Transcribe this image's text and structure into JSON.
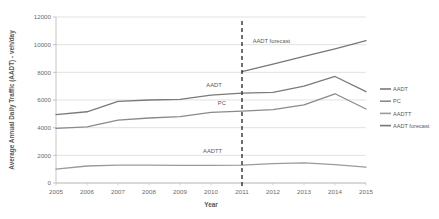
{
  "chart_data": {
    "type": "line",
    "title": "",
    "xlabel": "Year",
    "ylabel": "Average Annual Daily Traffic (AADT) - veh/day",
    "x": [
      2005,
      2006,
      2007,
      2008,
      2009,
      2010,
      2011,
      2012,
      2013,
      2014,
      2015
    ],
    "xtick_labels": [
      "2005",
      "2006",
      "2007",
      "2008",
      "2009",
      "2010",
      "2011",
      "2012",
      "2013",
      "2014",
      "2015"
    ],
    "ytick_labels": [
      "0",
      "2000",
      "4000",
      "6000",
      "8000",
      "10000",
      "12000"
    ],
    "yticks": [
      0,
      2000,
      4000,
      6000,
      8000,
      10000,
      12000
    ],
    "ylim": [
      0,
      12000
    ],
    "xlim": [
      2005,
      2015
    ],
    "grid": "horizontal",
    "legend_position": "right",
    "series": [
      {
        "name": "AADT",
        "color": "#7a7a7a",
        "x": [
          2005,
          2006,
          2007,
          2008,
          2009,
          2010,
          2011,
          2012,
          2013,
          2014,
          2015
        ],
        "values": [
          4950,
          5150,
          5900,
          6000,
          6050,
          6350,
          6500,
          6550,
          7000,
          7700,
          6600
        ]
      },
      {
        "name": "PC",
        "color": "#8a8a8a",
        "x": [
          2005,
          2006,
          2007,
          2008,
          2009,
          2010,
          2011,
          2012,
          2013,
          2014,
          2015
        ],
        "values": [
          3950,
          4050,
          4550,
          4700,
          4800,
          5100,
          5200,
          5300,
          5650,
          6450,
          5350
        ]
      },
      {
        "name": "AADTT",
        "color": "#9a9a9a",
        "x": [
          2005,
          2006,
          2007,
          2008,
          2009,
          2010,
          2011,
          2012,
          2013,
          2014,
          2015
        ],
        "values": [
          1000,
          1230,
          1290,
          1290,
          1280,
          1280,
          1290,
          1400,
          1450,
          1330,
          1150
        ]
      },
      {
        "name": "AADT forecast",
        "color": "#777777",
        "x": [
          2011,
          2012,
          2013,
          2014,
          2015
        ],
        "values": [
          8050,
          8600,
          9150,
          9700,
          10300
        ]
      }
    ],
    "annotations": [
      {
        "name": "aadt-inplot-label",
        "text": "AADT",
        "x": 2010.1,
        "y": 6950
      },
      {
        "name": "pc-inplot-label",
        "text": "PC",
        "x": 2010.35,
        "y": 5650
      },
      {
        "name": "aadtt-inplot-label",
        "text": "AADTT",
        "x": 2010.05,
        "y": 2150
      },
      {
        "name": "aadt-forecast-inplot-label",
        "text": "AADT forecast",
        "x": 2011.95,
        "y": 10150
      }
    ],
    "reference_line": {
      "name": "forecast-divider",
      "x": 2011,
      "style": "dashed",
      "color": "#333333"
    }
  },
  "legend": {
    "items": [
      {
        "label": "AADT",
        "color": "#7a7a7a"
      },
      {
        "label": "PC",
        "color": "#8a8a8a"
      },
      {
        "label": "AADTT",
        "color": "#9a9a9a"
      },
      {
        "label": "AADT forecast",
        "color": "#777777"
      }
    ]
  }
}
